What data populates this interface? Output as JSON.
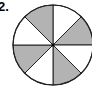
{
  "problem": {
    "label": "2."
  },
  "diagram": {
    "type": "fraction-circle",
    "total_parts": 8,
    "shaded_parts": 4,
    "slices": [
      {
        "index": 0,
        "position": "top-right",
        "shaded": false
      },
      {
        "index": 1,
        "position": "right-upper",
        "shaded": true
      },
      {
        "index": 2,
        "position": "right-lower",
        "shaded": false
      },
      {
        "index": 3,
        "position": "bottom-right",
        "shaded": true
      },
      {
        "index": 4,
        "position": "bottom-left",
        "shaded": false
      },
      {
        "index": 5,
        "position": "left-lower",
        "shaded": true
      },
      {
        "index": 6,
        "position": "left-upper",
        "shaded": false
      },
      {
        "index": 7,
        "position": "top-left",
        "shaded": true
      }
    ],
    "colors": {
      "shaded": "#b3b3b3",
      "unshaded": "#ffffff",
      "stroke": "#222222"
    }
  }
}
